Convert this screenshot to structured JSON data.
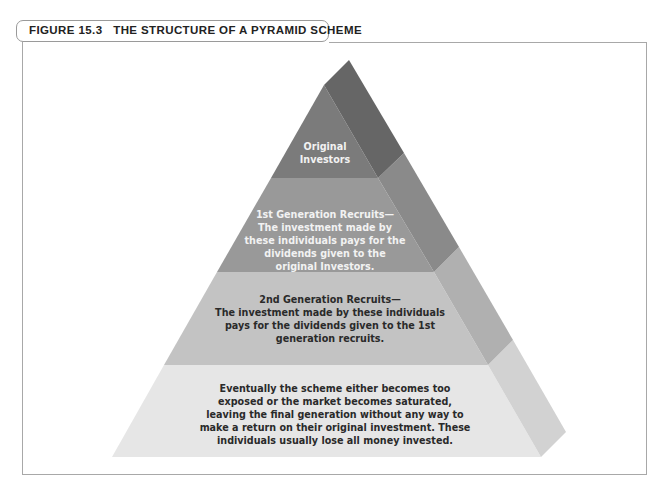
{
  "figure": {
    "title": "FIGURE 15.3   THE STRUCTURE OF A PYRAMID SCHEME"
  },
  "pyramid": {
    "levels": [
      {
        "name": "original-investors",
        "lines": [
          "Original",
          "Investors"
        ],
        "front_color": "#7b7b7b",
        "side_color": "#666666"
      },
      {
        "name": "first-generation",
        "lines": [
          "1st Generation Recruits—",
          "The investment made by",
          "these individuals pays for the",
          "dividends given to the",
          "original Investors."
        ],
        "front_color": "#999999",
        "side_color": "#8a8a8a"
      },
      {
        "name": "second-generation",
        "lines": [
          "2nd Generation Recruits—",
          "The investment made by these individuals",
          "pays for the dividends given to the 1st",
          "generation recruits."
        ],
        "front_color": "#c3c3c3",
        "side_color": "#b0b0b0"
      },
      {
        "name": "final-generation",
        "lines": [
          "Eventually the scheme either becomes too",
          "exposed or the market becomes saturated,",
          "leaving the final generation without any way to",
          "make a return on their original investment. These",
          "individuals usually lose all money invested."
        ],
        "front_color": "#e6e6e6",
        "side_color": "#d2d2d2"
      }
    ]
  }
}
